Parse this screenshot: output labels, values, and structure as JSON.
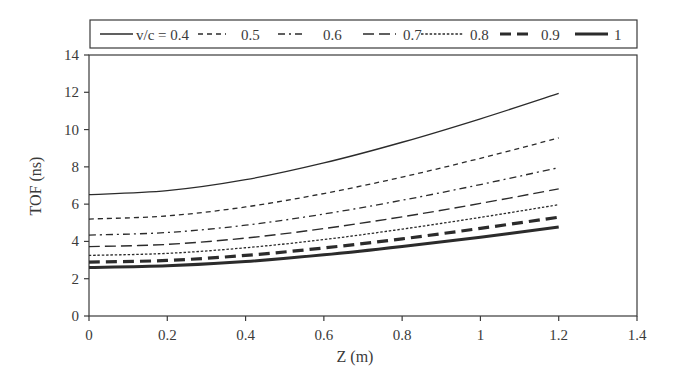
{
  "chart_data": {
    "type": "line",
    "title": "",
    "xlabel": "Z (m)",
    "ylabel": "TOF (ns)",
    "xlim": [
      0,
      1.4
    ],
    "ylim": [
      0,
      14
    ],
    "xticks": [
      0,
      0.2,
      0.4,
      0.6,
      0.8,
      1,
      1.2,
      1.4
    ],
    "xtick_labels": [
      "0",
      "0.2",
      "0.4",
      "0.6",
      "0.8",
      "1",
      "1.2",
      "1.4"
    ],
    "yticks": [
      0,
      2,
      4,
      6,
      8,
      10,
      12,
      14
    ],
    "ytick_labels": [
      "0",
      "2",
      "4",
      "6",
      "8",
      "10",
      "12",
      "14"
    ],
    "grid": false,
    "legend_position": "top (above plot, boxed, single row)",
    "x": [
      0,
      0.2,
      0.4,
      0.6,
      0.8,
      1.0,
      1.2
    ],
    "series": [
      {
        "name": "v/c = 0.4",
        "legend_label": "v/c = 0.4",
        "style": "solid-thin",
        "values": [
          6.51,
          6.72,
          7.31,
          8.21,
          9.32,
          10.58,
          11.94
        ]
      },
      {
        "name": "0.5",
        "legend_label": "0.5",
        "style": "short-dash",
        "values": [
          5.2,
          5.37,
          5.85,
          6.57,
          7.45,
          8.46,
          9.55
        ]
      },
      {
        "name": "0.6",
        "legend_label": "0.6",
        "style": "dash-dot",
        "values": [
          4.34,
          4.48,
          4.87,
          5.47,
          6.21,
          7.05,
          7.96
        ]
      },
      {
        "name": "0.7",
        "legend_label": "0.7",
        "style": "long-dash",
        "values": [
          3.72,
          3.84,
          4.18,
          4.69,
          5.32,
          6.04,
          6.82
        ]
      },
      {
        "name": "0.8",
        "legend_label": "0.8",
        "style": "dotted",
        "values": [
          3.25,
          3.36,
          3.66,
          4.1,
          4.66,
          5.29,
          5.97
        ]
      },
      {
        "name": "0.9",
        "legend_label": "0.9",
        "style": "bold-dash",
        "values": [
          2.89,
          2.98,
          3.25,
          3.65,
          4.14,
          4.7,
          5.3
        ]
      },
      {
        "name": "1",
        "legend_label": "1",
        "style": "bold-solid",
        "values": [
          2.6,
          2.69,
          2.92,
          3.28,
          3.73,
          4.23,
          4.77
        ]
      }
    ],
    "line_color": "#2b2b2b"
  }
}
